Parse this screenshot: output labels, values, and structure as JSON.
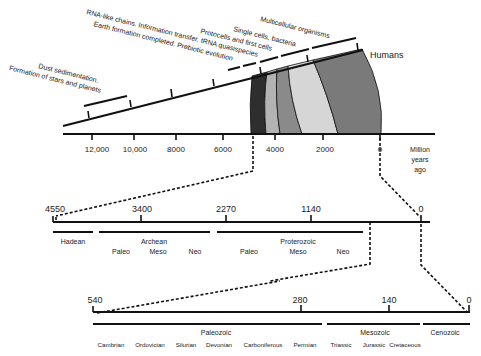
{
  "diagram": {
    "title": "",
    "top_timeline": {
      "axis_ticks": [
        "12,000",
        "10,000",
        "8000",
        "6000",
        "4000",
        "2000",
        "0"
      ],
      "axis_unit": [
        "Million",
        "years",
        "ago"
      ],
      "events": [
        {
          "label_line1": "Dust sedimentation.",
          "label_line2": "Formation of stars and planets"
        },
        {
          "label_line1": "RNA-like chains. Information transfer. tRNA quasispecies",
          "label_line2": "Earth formation completed. Prebiotic evolution"
        },
        {
          "label": "Protocells and first cells"
        },
        {
          "label": "Single cells, bacteria"
        },
        {
          "label": "Multicellular organisms"
        },
        {
          "label": "Humans"
        }
      ],
      "bands": [
        {
          "name": "band-1",
          "color": "#2e2e2e"
        },
        {
          "name": "band-2",
          "color": "#b3b3b3"
        },
        {
          "name": "band-3",
          "color": "#8a8a8a"
        },
        {
          "name": "band-4",
          "color": "#d6d6d6"
        },
        {
          "name": "band-5",
          "color": "#7a7a7a"
        }
      ]
    },
    "precambrian_timeline": {
      "ticks": [
        "4550",
        "3400",
        "2270",
        "1140",
        "0"
      ],
      "eons": [
        {
          "label": "Hadean",
          "sub": []
        },
        {
          "label": "Archean",
          "sub": [
            "Paleo",
            "Meso",
            "Neo"
          ]
        },
        {
          "label": "Proterozoic",
          "sub": [
            "Paleo",
            "Meso",
            "Neo"
          ]
        }
      ]
    },
    "phanerozoic_timeline": {
      "ticks": [
        "540",
        "280",
        "140",
        "0"
      ],
      "eras": [
        {
          "label": "Paleozoic",
          "periods": [
            "Cambrian",
            "Ordovician",
            "Silurian",
            "Devonian",
            "Carboniferous",
            "Permian"
          ]
        },
        {
          "label": "Mesozoic",
          "periods": [
            "Triassic",
            "Jurassic",
            "Cretaceous"
          ]
        },
        {
          "label": "Cenozoic",
          "periods": []
        }
      ]
    }
  }
}
